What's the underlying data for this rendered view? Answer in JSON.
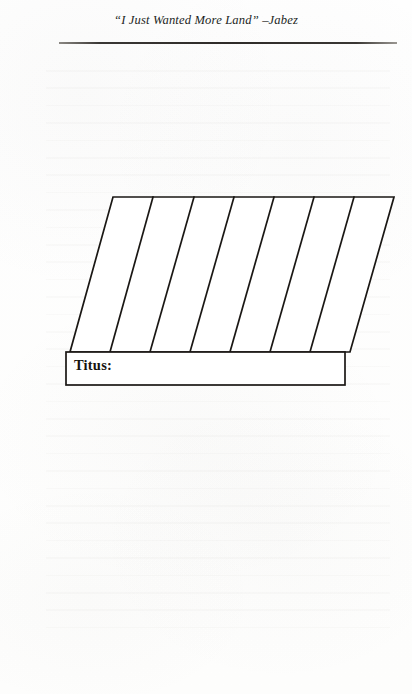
{
  "page": {
    "running_head": "“I Just Wanted More Land” –Jabez",
    "background_color": "#fefefe",
    "ink_color": "#17140f"
  },
  "diagram": {
    "name": "land-strip-diagram",
    "type": "parallelogram-strips",
    "strip_count": 7,
    "divider_count": 6,
    "label_box": {
      "label": "Titus:",
      "value": ""
    },
    "geometry": {
      "top_left": [
        113,
        197
      ],
      "top_right": [
        394,
        197
      ],
      "bottom_left": [
        70,
        352
      ],
      "bottom_right": [
        350,
        352
      ],
      "slant_offset_px": 43,
      "top_divider_x": [
        153,
        194,
        234,
        274,
        314,
        354
      ],
      "bottom_divider_x": [
        110,
        150,
        190,
        230,
        270,
        310
      ],
      "label_box_rect": [
        66,
        352,
        279,
        33
      ],
      "stroke_width": 1.6,
      "stroke_color": "#1a1714"
    }
  }
}
